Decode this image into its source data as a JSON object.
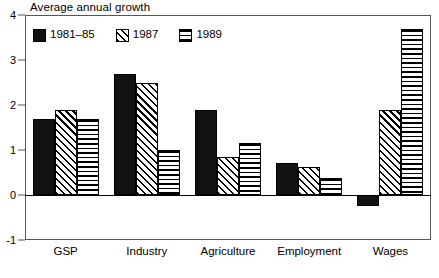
{
  "chart_data": {
    "type": "bar",
    "title": "Average annual growth",
    "xlabel": "",
    "ylabel": "",
    "ylim": [
      -1,
      4
    ],
    "yticks": [
      -1,
      0,
      1,
      2,
      3,
      4
    ],
    "ytick_labels": [
      "-1",
      "0",
      "1",
      "2",
      "3",
      "4"
    ],
    "grid": false,
    "legend_position": "top-left-inside",
    "categories": [
      "GSP",
      "Industry",
      "Agriculture",
      "Employment",
      "Wages"
    ],
    "series": [
      {
        "name": "1981–85",
        "pattern": "solid",
        "values": [
          1.7,
          2.7,
          1.9,
          0.72,
          -0.25
        ]
      },
      {
        "name": "1987",
        "pattern": "diagonal-hatch",
        "values": [
          1.9,
          2.5,
          0.85,
          0.62,
          1.9
        ]
      },
      {
        "name": "1989",
        "pattern": "horizontal-lines",
        "values": [
          1.7,
          1.0,
          1.15,
          0.38,
          3.7
        ]
      }
    ]
  },
  "colors": {
    "series_fill": "#111111",
    "frame": "#555555",
    "background": "#ffffff",
    "text": "#000000"
  }
}
